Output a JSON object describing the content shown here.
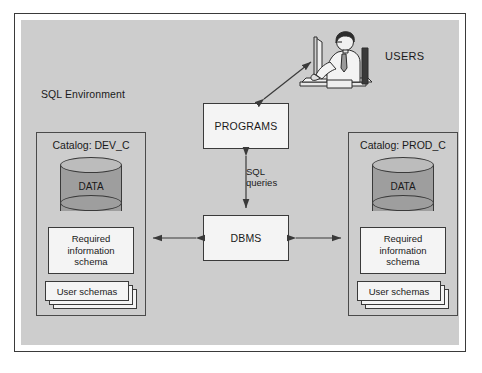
{
  "diagram": {
    "title": "SQL Environment",
    "environment_label": "SQL Environment",
    "users_label": "USERS",
    "center": {
      "programs_label": "PROGRAMS",
      "dbms_label": "DBMS",
      "link_label_line1": "SQL",
      "link_label_line2": "queries"
    },
    "catalogs": [
      {
        "id": "dev",
        "title": "Catalog: DEV_C",
        "data_label": "DATA",
        "required_schema_line1": "Required",
        "required_schema_line2": "information",
        "required_schema_line3": "schema",
        "user_schemas_label": "User schemas"
      },
      {
        "id": "prod",
        "title": "Catalog: PROD_C",
        "data_label": "DATA",
        "required_schema_line1": "Required",
        "required_schema_line2": "information",
        "required_schema_line3": "schema",
        "user_schemas_label": "User schemas"
      }
    ],
    "icons": {
      "person_at_laptop": "user-at-computer-icon",
      "database": "database-cylinder-icon"
    },
    "colors": {
      "page_background": "#ffffff",
      "environment_panel": "#cdcdcd",
      "box_fill": "#f4f4f4",
      "cylinder_fill": "#9e9e9e",
      "cylinder_top_fill": "#bcbcbc",
      "stroke": "#3a3a3a",
      "text": "#1a1a1a"
    },
    "connections": [
      {
        "from": "PROGRAMS",
        "to": "USERS",
        "style": "double-arrow",
        "label": ""
      },
      {
        "from": "PROGRAMS",
        "to": "DBMS",
        "style": "double-arrow",
        "label": "SQL queries"
      },
      {
        "from": "DBMS",
        "to": "Catalog: DEV_C",
        "style": "double-arrow",
        "label": ""
      },
      {
        "from": "DBMS",
        "to": "Catalog: PROD_C",
        "style": "double-arrow",
        "label": ""
      }
    ]
  }
}
